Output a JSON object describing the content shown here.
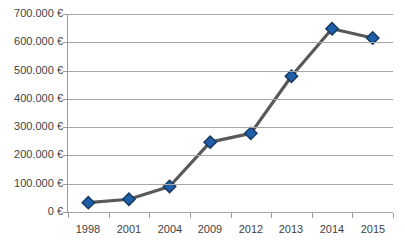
{
  "chart_data": {
    "type": "line",
    "title": "",
    "xlabel": "",
    "ylabel": "",
    "categories": [
      "1998",
      "2001",
      "2004",
      "2009",
      "2012",
      "2013",
      "2014",
      "2015"
    ],
    "values": [
      33000,
      45000,
      90000,
      247000,
      278000,
      480000,
      648000,
      615000
    ],
    "series": [
      {
        "name": "",
        "values": [
          33000,
          45000,
          90000,
          247000,
          278000,
          480000,
          648000,
          615000
        ]
      }
    ],
    "ylim": [
      0,
      700000
    ],
    "ytick_values": [
      0,
      100000,
      200000,
      300000,
      400000,
      500000,
      600000,
      700000
    ],
    "ytick_labels": [
      "0 €",
      "100.000 €",
      "200.000 €",
      "300.000 €",
      "400.000 €",
      "500.000 €",
      "600.000 €",
      "700.000 €"
    ],
    "grid": true,
    "legend": "none",
    "marker": "diamond",
    "currency_symbol": "€",
    "colors": {
      "marker_fill": "#1f5fa9",
      "marker_border": "#16365c",
      "line": "#595959",
      "gridline": "#a6a6a6",
      "axis": "#9a9a9a",
      "text": "#3f3f3f",
      "background": "#ffffff"
    }
  }
}
